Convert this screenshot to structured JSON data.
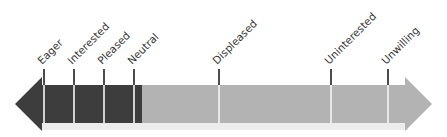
{
  "diagram": {
    "type": "spectrum-arrow",
    "colors": {
      "dark_segment": "#3d3d3d",
      "light_segment": "#b3b3b3",
      "shadow": "#ececec",
      "tick_above": "#1e1e1e",
      "tick_inside": "#f5f5f5",
      "label_text": "#333333"
    },
    "markers": [
      {
        "label": "Eager",
        "x": 44
      },
      {
        "label": "Interested",
        "x": 74
      },
      {
        "label": "Pleased",
        "x": 104
      },
      {
        "label": "Neutral",
        "x": 134
      },
      {
        "label": "Displeased",
        "x": 219
      },
      {
        "label": "Uninterested",
        "x": 331
      },
      {
        "label": "Unwilling",
        "x": 388
      }
    ]
  }
}
